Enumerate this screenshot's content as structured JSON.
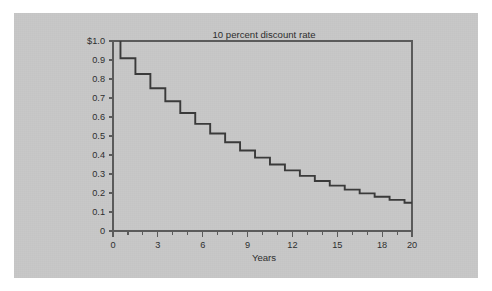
{
  "figure": {
    "panel_color": "#c8c8c8",
    "page_color": "#ffffff",
    "axis_color": "#5a5a5a",
    "series_color": "#3a3a3a"
  },
  "chart_data": {
    "type": "line",
    "subtype": "step",
    "title": "10 percent discount rate",
    "xlabel": "Years",
    "ylabel": "",
    "xlim": [
      0,
      20
    ],
    "ylim": [
      0,
      1.0
    ],
    "grid": false,
    "legend": null,
    "x_ticks_major": [
      0,
      3,
      6,
      9,
      12,
      15,
      18,
      20
    ],
    "x_tick_labels": [
      "0",
      "3",
      "6",
      "9",
      "12",
      "15",
      "18",
      "20"
    ],
    "x_ticks_minor": [
      0,
      1,
      2,
      3,
      4,
      5,
      6,
      7,
      8,
      9,
      10,
      11,
      12,
      13,
      14,
      15,
      16,
      17,
      18,
      19,
      20
    ],
    "y_ticks": [
      0,
      0.1,
      0.2,
      0.3,
      0.4,
      0.5,
      0.6,
      0.7,
      0.8,
      0.9,
      1.0
    ],
    "y_tick_labels": [
      "0",
      "0.1",
      "0.2",
      "0.3",
      "0.4",
      "0.5",
      "0.6",
      "0.7",
      "0.8",
      "0.9",
      "$1.0"
    ],
    "x": [
      0,
      1,
      2,
      3,
      4,
      5,
      6,
      7,
      8,
      9,
      10,
      11,
      12,
      13,
      14,
      15,
      16,
      17,
      18,
      19,
      20
    ],
    "values": [
      1.0,
      0.909,
      0.826,
      0.751,
      0.683,
      0.621,
      0.564,
      0.513,
      0.467,
      0.424,
      0.386,
      0.35,
      0.319,
      0.29,
      0.263,
      0.239,
      0.218,
      0.198,
      0.18,
      0.164,
      0.149
    ],
    "series": [
      {
        "name": "Present value of $1 at 10% discount rate",
        "values": [
          1.0,
          0.909,
          0.826,
          0.751,
          0.683,
          0.621,
          0.564,
          0.513,
          0.467,
          0.424,
          0.386,
          0.35,
          0.319,
          0.29,
          0.263,
          0.239,
          0.218,
          0.198,
          0.18,
          0.164,
          0.149
        ]
      }
    ],
    "annotations": []
  }
}
